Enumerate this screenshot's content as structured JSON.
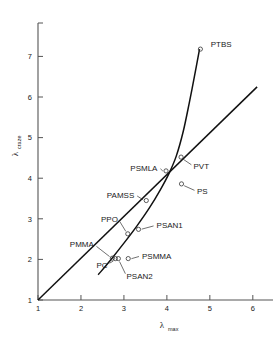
{
  "chart_data": {
    "type": "scatter",
    "title": "",
    "xlabel": "λ",
    "xlabel_sub": "max",
    "ylabel": "λ",
    "ylabel_sub": "craze",
    "xlim": [
      1,
      6.4
    ],
    "ylim": [
      1,
      7.7
    ],
    "xticks": [
      1,
      2,
      3,
      4,
      5,
      6
    ],
    "yticks": [
      1,
      2,
      3,
      4,
      5,
      6,
      7
    ],
    "xtick_labels": [
      "1",
      "2",
      "3",
      "4",
      "5",
      "6"
    ],
    "ytick_labels": [
      "1",
      "2",
      "3",
      "4",
      "5",
      "6",
      "7"
    ],
    "grid": false,
    "legend": false,
    "points": [
      {
        "label": "PTBS",
        "x": 4.78,
        "y": 7.18,
        "label_x": 5.02,
        "label_y": 7.22,
        "anchor": "start",
        "leader": false
      },
      {
        "label": "PVT",
        "x": 4.33,
        "y": 4.52,
        "label_x": 4.62,
        "label_y": 4.22,
        "anchor": "start",
        "leader": true
      },
      {
        "label": "PS",
        "x": 4.34,
        "y": 3.86,
        "label_x": 4.7,
        "label_y": 3.6,
        "anchor": "start",
        "leader": true
      },
      {
        "label": "PSMLA",
        "x": 3.98,
        "y": 4.18,
        "label_x": 3.78,
        "label_y": 4.17,
        "anchor": "end",
        "leader": true
      },
      {
        "label": "PAMSS",
        "x": 3.52,
        "y": 3.45,
        "label_x": 3.24,
        "label_y": 3.52,
        "anchor": "end",
        "leader": true
      },
      {
        "label": "PSAN1",
        "x": 3.34,
        "y": 2.74,
        "label_x": 3.76,
        "label_y": 2.77,
        "anchor": "start",
        "leader": true
      },
      {
        "label": "PPO",
        "x": 3.09,
        "y": 2.63,
        "label_x": 2.86,
        "label_y": 2.93,
        "anchor": "end",
        "leader": true
      },
      {
        "label": "PSMMA",
        "x": 3.1,
        "y": 2.02,
        "label_x": 3.42,
        "label_y": 2.01,
        "anchor": "start",
        "leader": true
      },
      {
        "label": "PMMA",
        "x": 2.73,
        "y": 2.03,
        "label_x": 2.3,
        "label_y": 2.3,
        "anchor": "end",
        "leader": true
      },
      {
        "label": "PC",
        "x": 2.8,
        "y": 2.02,
        "label_x": 2.62,
        "label_y": 1.79,
        "anchor": "end",
        "leader": true
      },
      {
        "label": "PSAN2",
        "x": 2.87,
        "y": 2.02,
        "label_x": 3.06,
        "label_y": 1.52,
        "anchor": "start",
        "leader": true
      }
    ],
    "curves": [
      {
        "name": "upturn-curve",
        "description": "steep rising curve through the cluster up to PTBS",
        "points": [
          [
            2.4,
            1.62
          ],
          [
            2.7,
            2.0
          ],
          [
            3.0,
            2.4
          ],
          [
            3.3,
            2.82
          ],
          [
            3.6,
            3.28
          ],
          [
            3.85,
            3.72
          ],
          [
            4.05,
            4.12
          ],
          [
            4.22,
            4.55
          ],
          [
            4.38,
            5.15
          ],
          [
            4.52,
            5.85
          ],
          [
            4.64,
            6.5
          ],
          [
            4.76,
            7.18
          ]
        ]
      },
      {
        "name": "diagonal-line",
        "description": "near straight line from origin of axes to upper right",
        "points": [
          [
            1.0,
            1.0
          ],
          [
            6.1,
            6.25
          ]
        ]
      }
    ]
  },
  "axes": {
    "x_axis_name": "lambda-max-axis",
    "y_axis_name": "lambda-craze-axis"
  }
}
